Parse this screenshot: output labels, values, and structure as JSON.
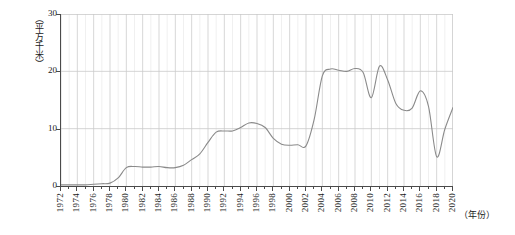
{
  "chart_data": {
    "type": "line",
    "title": "",
    "xlabel": "（年份）",
    "ylabel": "（平方千米）",
    "xlim": [
      1972,
      2020
    ],
    "ylim": [
      0,
      30
    ],
    "yticks": [
      0,
      10,
      20,
      30
    ],
    "ytick_labels": [
      "0",
      "10",
      "20",
      "30"
    ],
    "xticks": [
      1972,
      1974,
      1976,
      1978,
      1980,
      1982,
      1984,
      1986,
      1988,
      1990,
      1992,
      1994,
      1996,
      1998,
      2000,
      2002,
      2004,
      2006,
      2008,
      2010,
      2012,
      2014,
      2016,
      2018,
      2020
    ],
    "xtick_labels": [
      "1972",
      "1974",
      "1976",
      "1978",
      "1980",
      "1982",
      "1984",
      "1986",
      "1988",
      "1990",
      "1992",
      "1994",
      "1996",
      "1998",
      "2000",
      "2002",
      "2004",
      "2006",
      "2008",
      "2010",
      "2012",
      "2014",
      "2016",
      "2018",
      "2020"
    ],
    "grid": true,
    "grid_minor_x": true,
    "legend": null,
    "line_color": "#8a8a8a",
    "grid_color": "#c9c9c9",
    "minor_grid_color": "#e3e3e3",
    "axis_color": "#4a4a4a",
    "x": [
      1972,
      1973,
      1974,
      1975,
      1976,
      1977,
      1978,
      1979,
      1980,
      1981,
      1982,
      1983,
      1984,
      1985,
      1986,
      1987,
      1988,
      1989,
      1990,
      1991,
      1992,
      1993,
      1994,
      1995,
      1996,
      1997,
      1998,
      1999,
      2000,
      2001,
      2002,
      2003,
      2004,
      2005,
      2006,
      2007,
      2008,
      2009,
      2010,
      2011,
      2012,
      2013,
      2014,
      2015,
      2016,
      2017,
      2018,
      2019,
      2020
    ],
    "values": [
      0.2,
      0.2,
      0.2,
      0.2,
      0.3,
      0.4,
      0.5,
      1.4,
      3.2,
      3.4,
      3.3,
      3.3,
      3.4,
      3.2,
      3.2,
      3.6,
      4.6,
      5.6,
      7.6,
      9.4,
      9.6,
      9.6,
      10.2,
      11.0,
      10.9,
      10.2,
      8.3,
      7.3,
      7.1,
      7.2,
      7.0,
      11.6,
      19.2,
      20.4,
      20.2,
      20.0,
      20.5,
      19.8,
      15.4,
      20.9,
      18.5,
      14.4,
      13.2,
      13.6,
      16.6,
      13.9,
      5.1,
      9.9,
      13.7
    ],
    "series": [
      {
        "name": "面积",
        "values": [
          0.2,
          0.2,
          0.2,
          0.2,
          0.3,
          0.4,
          0.5,
          1.4,
          3.2,
          3.4,
          3.3,
          3.3,
          3.4,
          3.2,
          3.2,
          3.6,
          4.6,
          5.6,
          7.6,
          9.4,
          9.6,
          9.6,
          10.2,
          11.0,
          10.9,
          10.2,
          8.3,
          7.3,
          7.1,
          7.2,
          7.0,
          11.6,
          19.2,
          20.4,
          20.2,
          20.0,
          20.5,
          19.8,
          15.4,
          20.9,
          18.5,
          14.4,
          13.2,
          13.6,
          16.6,
          13.9,
          5.1,
          9.9,
          13.7
        ]
      }
    ]
  }
}
